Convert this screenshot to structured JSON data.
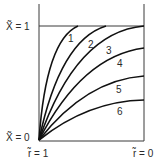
{
  "diagram": {
    "type": "family-of-curves",
    "labels": {
      "x_top": "X̃ = 1",
      "x_bottom": "X̃ = 0",
      "r_left": "r̃ = 1",
      "r_right": "r̃ = 0"
    },
    "curves": [
      {
        "id": "1",
        "label": "1",
        "end": "reaches X=1 at ~37% of width"
      },
      {
        "id": "2",
        "label": "2",
        "end": "reaches X=1 at ~64% of width"
      },
      {
        "id": "3",
        "label": "3",
        "end": "reaches X=1 at r=0"
      },
      {
        "id": "4",
        "label": "4",
        "end_value": 0.81
      },
      {
        "id": "5",
        "label": "5",
        "end_value": 0.56
      },
      {
        "id": "6",
        "label": "6",
        "end_value": 0.35
      }
    ],
    "colors": {
      "line": "#111111",
      "axis": "#3a3a3a",
      "background": "#ffffff"
    }
  }
}
